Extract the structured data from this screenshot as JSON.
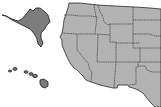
{
  "map": {
    "title": "Western United States map with Alaska and Hawaii",
    "colors": {
      "background": "#ffffff",
      "state_fill": "#b3b3b3",
      "highlight_fill": "#7d7d7d",
      "border": "#2a2a2a"
    },
    "highlighted": [
      "Alaska",
      "Hawaii"
    ],
    "states_visible": [
      "Washington",
      "Oregon",
      "California",
      "Idaho",
      "Nevada",
      "Utah",
      "Arizona",
      "Montana",
      "Wyoming",
      "Colorado",
      "New Mexico",
      "North Dakota",
      "South Dakota",
      "Nebraska",
      "Kansas",
      "Oklahoma",
      "Texas",
      "Alaska",
      "Hawaii"
    ]
  }
}
